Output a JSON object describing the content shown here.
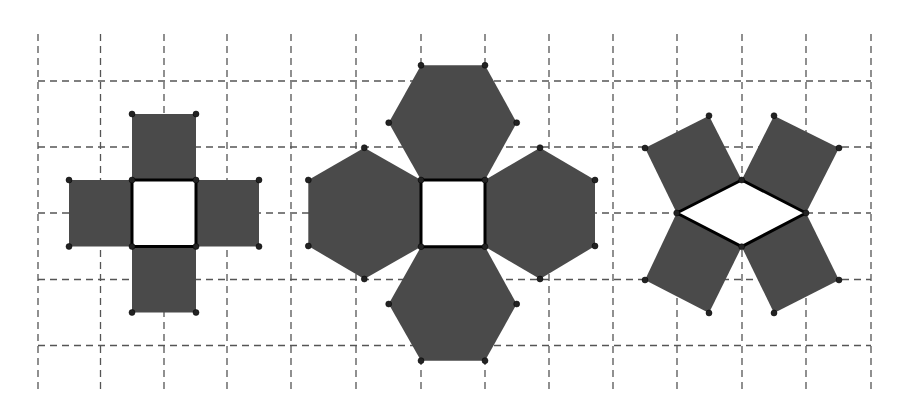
{
  "diagram": {
    "title": "",
    "colors": {
      "background": "#ffffff",
      "grid": "#555555",
      "face_fill": "#4a4a4a",
      "base_fill": "#ffffff",
      "edge": "#000000",
      "vertex": "#222222"
    },
    "grid": {
      "x_lines": [
        38,
        100.5,
        164,
        227,
        291,
        356,
        421,
        485,
        549,
        613,
        677,
        742,
        806,
        871
      ],
      "y_lines": [
        81,
        147,
        213,
        279.5,
        345.5
      ],
      "x_extent": [
        38,
        871
      ],
      "y_extent": [
        34,
        392
      ]
    },
    "figures": [
      {
        "name": "square-with-four-squares",
        "base": {
          "shape": "square",
          "points": [
            [
              132,
              180
            ],
            [
              196,
              180
            ],
            [
              196,
              246.5
            ],
            [
              132,
              246.5
            ]
          ]
        },
        "faces": [
          {
            "shape": "square",
            "points": [
              [
                132,
                180
              ],
              [
                196,
                180
              ],
              [
                196,
                114
              ],
              [
                132,
                114
              ]
            ]
          },
          {
            "shape": "square",
            "points": [
              [
                132,
                246.5
              ],
              [
                196,
                246.5
              ],
              [
                196,
                312.5
              ],
              [
                132,
                312.5
              ]
            ]
          },
          {
            "shape": "square",
            "points": [
              [
                132,
                180
              ],
              [
                132,
                246.5
              ],
              [
                69,
                246.5
              ],
              [
                69,
                180
              ]
            ]
          },
          {
            "shape": "square",
            "points": [
              [
                196,
                180
              ],
              [
                196,
                246.5
              ],
              [
                259,
                246.5
              ],
              [
                259,
                180
              ]
            ]
          }
        ]
      },
      {
        "name": "square-with-four-hexagons",
        "base": {
          "shape": "square",
          "points": [
            [
              421,
              180
            ],
            [
              485,
              180
            ],
            [
              485,
              246.7
            ],
            [
              421,
              246.7
            ]
          ]
        },
        "faces": [
          {
            "shape": "hexagon",
            "points": [
              [
                421,
                180
              ],
              [
                485,
                180
              ],
              [
                516.7,
                122.7
              ],
              [
                485,
                65.3
              ],
              [
                421,
                65.3
              ],
              [
                388.7,
                122.7
              ]
            ]
          },
          {
            "shape": "hexagon",
            "points": [
              [
                421,
                246.7
              ],
              [
                485,
                246.7
              ],
              [
                516.7,
                304
              ],
              [
                485,
                360.7
              ],
              [
                421,
                360.7
              ],
              [
                388.7,
                304
              ]
            ]
          },
          {
            "shape": "hexagon",
            "points": [
              [
                421,
                180
              ],
              [
                421,
                246.7
              ],
              [
                364.3,
                279
              ],
              [
                308.3,
                246
              ],
              [
                308.3,
                180
              ],
              [
                364.3,
                147.7
              ]
            ]
          },
          {
            "shape": "hexagon",
            "points": [
              [
                485,
                180
              ],
              [
                485,
                246.7
              ],
              [
                540,
                279
              ],
              [
                595,
                246
              ],
              [
                595,
                180
              ],
              [
                540,
                147.7
              ]
            ]
          }
        ]
      },
      {
        "name": "rhombus-with-four-rectangles",
        "base": {
          "shape": "rhombus",
          "points": [
            [
              676.7,
              213
            ],
            [
              741.7,
              180
            ],
            [
              806,
              213
            ],
            [
              741.7,
              246.7
            ]
          ]
        },
        "faces": [
          {
            "shape": "rectangle",
            "points": [
              [
                676.7,
                213
              ],
              [
                741.7,
                180
              ],
              [
                709,
                115.7
              ],
              [
                645,
                148
              ]
            ]
          },
          {
            "shape": "rectangle",
            "points": [
              [
                741.7,
                180
              ],
              [
                806,
                213
              ],
              [
                839,
                148
              ],
              [
                774,
                115.7
              ]
            ]
          },
          {
            "shape": "rectangle",
            "points": [
              [
                676.7,
                213
              ],
              [
                741.7,
                246.7
              ],
              [
                709,
                313
              ],
              [
                645,
                280
              ]
            ]
          },
          {
            "shape": "rectangle",
            "points": [
              [
                806,
                213
              ],
              [
                741.7,
                246.7
              ],
              [
                774,
                313
              ],
              [
                839,
                280
              ]
            ]
          }
        ]
      }
    ]
  }
}
